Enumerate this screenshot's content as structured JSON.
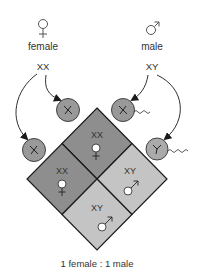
{
  "parents": {
    "female": {
      "symbol": "♀",
      "label": "female",
      "genotype": "XX"
    },
    "male": {
      "symbol": "♂",
      "label": "male",
      "genotype": "XY"
    }
  },
  "gametes": {
    "egg_top": {
      "chromosome": "X",
      "type": "egg"
    },
    "egg_left": {
      "chromosome": "X",
      "type": "egg"
    },
    "sperm_top": {
      "chromosome": "X",
      "type": "sperm"
    },
    "sperm_right": {
      "chromosome": "Y",
      "type": "sperm"
    }
  },
  "offspring": [
    {
      "genotype": "XX",
      "sex": "female",
      "symbol": "♀"
    },
    {
      "genotype": "XX",
      "sex": "female",
      "symbol": "♀"
    },
    {
      "genotype": "XY",
      "sex": "male",
      "symbol": "♂"
    },
    {
      "genotype": "XY",
      "sex": "male",
      "symbol": "♂"
    }
  ],
  "ratio": "1 female : 1 male",
  "colors": {
    "female_cell": "#8e8e8e",
    "male_cell": "#c4c4c4",
    "gamete": "#999999",
    "outline": "#1a1a1a",
    "text": "#333333"
  }
}
